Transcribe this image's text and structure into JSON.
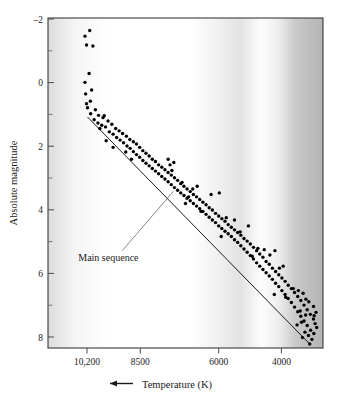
{
  "chart_data": {
    "type": "scatter",
    "title": "",
    "subtitle": "",
    "xlabel": "Temperature (K)",
    "ylabel": "Absolute magnitude",
    "xlabel_prefix_icon": "left-arrow",
    "grid": false,
    "legend": null,
    "x_axis_reversed": true,
    "y_axis_reversed": true,
    "xlim": [
      11400,
      2700
    ],
    "ylim": [
      -2,
      8
    ],
    "x_ticks": [
      10200,
      8500,
      6000,
      4000
    ],
    "x_tick_labels": [
      "10,200",
      "8500",
      "6000",
      "4000"
    ],
    "y_ticks": [
      -2,
      0,
      2,
      4,
      6,
      8
    ],
    "y_tick_labels": [
      "–2",
      "0",
      "2",
      "4",
      "6",
      "8"
    ],
    "y_minor_ticks": [
      -1,
      1,
      3,
      5,
      7
    ],
    "annotations": [
      {
        "text": "Main sequence",
        "x": 9050,
        "y": 5.35,
        "leader_from_x": 9050,
        "leader_from_y": 5.05,
        "leader_to_x": 7430,
        "leader_to_y": 3.25
      }
    ],
    "trend_line": {
      "name": "Main sequence ridge",
      "x_start": 10150,
      "y_start": 1.0,
      "x_end": 3150,
      "y_end": 7.85
    },
    "background_gradient": {
      "description": "stellar color continuum behind plot",
      "stops": [
        {
          "pos": 0.0,
          "color": "#dcdcdc"
        },
        {
          "pos": 0.1,
          "color": "#f5f5f5"
        },
        {
          "pos": 0.22,
          "color": "#ffffff"
        },
        {
          "pos": 0.52,
          "color": "#ffffff"
        },
        {
          "pos": 0.62,
          "color": "#f0f0f0"
        },
        {
          "pos": 0.7,
          "color": "#e0e0e0"
        },
        {
          "pos": 0.78,
          "color": "#ffffff"
        },
        {
          "pos": 0.84,
          "color": "#f2f2f2"
        },
        {
          "pos": 0.9,
          "color": "#c8c8c8"
        },
        {
          "pos": 1.0,
          "color": "#b4b4b4"
        }
      ]
    },
    "marker": {
      "shape": "circle",
      "color": "#000000",
      "size_px": 3.4
    },
    "point_count": 171,
    "points": [
      [
        10080,
        -1.62
      ],
      [
        10230,
        -1.45
      ],
      [
        9980,
        -1.15
      ],
      [
        10180,
        -1.18
      ],
      [
        10100,
        -0.32
      ],
      [
        10230,
        -0.05
      ],
      [
        10020,
        0.18
      ],
      [
        10210,
        0.3
      ],
      [
        10060,
        0.52
      ],
      [
        10180,
        0.6
      ],
      [
        9900,
        0.78
      ],
      [
        10150,
        0.72
      ],
      [
        9800,
        0.95
      ],
      [
        10050,
        0.9
      ],
      [
        9660,
        1.02
      ],
      [
        9940,
        1.08
      ],
      [
        9500,
        1.12
      ],
      [
        9820,
        1.18
      ],
      [
        9380,
        1.22
      ],
      [
        9700,
        1.25
      ],
      [
        9260,
        1.35
      ],
      [
        9580,
        1.3
      ],
      [
        9150,
        1.42
      ],
      [
        9460,
        1.45
      ],
      [
        9040,
        1.5
      ],
      [
        9340,
        1.52
      ],
      [
        9620,
        0.96
      ],
      [
        9760,
        1.35
      ],
      [
        8920,
        1.58
      ],
      [
        9230,
        1.62
      ],
      [
        8810,
        1.68
      ],
      [
        9120,
        1.7
      ],
      [
        8700,
        1.75
      ],
      [
        9010,
        1.78
      ],
      [
        8600,
        1.82
      ],
      [
        8900,
        1.88
      ],
      [
        8500,
        1.92
      ],
      [
        8800,
        1.95
      ],
      [
        8400,
        2.02
      ],
      [
        8700,
        2.05
      ],
      [
        9340,
        1.92
      ],
      [
        9560,
        1.72
      ],
      [
        8300,
        2.1
      ],
      [
        8600,
        2.14
      ],
      [
        8200,
        2.18
      ],
      [
        8500,
        2.22
      ],
      [
        8100,
        2.28
      ],
      [
        8400,
        2.32
      ],
      [
        8000,
        2.35
      ],
      [
        8300,
        2.4
      ],
      [
        7900,
        2.45
      ],
      [
        8200,
        2.48
      ],
      [
        7800,
        2.52
      ],
      [
        8100,
        2.56
      ],
      [
        8760,
        2.28
      ],
      [
        8940,
        2.06
      ],
      [
        7700,
        2.6
      ],
      [
        8000,
        2.64
      ],
      [
        7600,
        2.68
      ],
      [
        7900,
        2.72
      ],
      [
        7500,
        2.76
      ],
      [
        7800,
        2.8
      ],
      [
        7400,
        2.84
      ],
      [
        7700,
        2.88
      ],
      [
        7300,
        2.92
      ],
      [
        7600,
        2.96
      ],
      [
        7200,
        3.02
      ],
      [
        7500,
        3.05
      ],
      [
        7600,
        2.28
      ],
      [
        7540,
        2.45
      ],
      [
        7480,
        2.62
      ],
      [
        7420,
        2.38
      ],
      [
        7100,
        3.1
      ],
      [
        7400,
        3.14
      ],
      [
        7000,
        3.18
      ],
      [
        7300,
        3.22
      ],
      [
        6900,
        3.26
      ],
      [
        7200,
        3.3
      ],
      [
        6800,
        3.35
      ],
      [
        7100,
        3.38
      ],
      [
        6700,
        3.42
      ],
      [
        7000,
        3.46
      ],
      [
        6600,
        3.5
      ],
      [
        6900,
        3.54
      ],
      [
        7160,
        2.98
      ],
      [
        7050,
        3.62
      ],
      [
        6500,
        3.58
      ],
      [
        6800,
        3.62
      ],
      [
        6400,
        3.66
      ],
      [
        6700,
        3.7
      ],
      [
        6300,
        3.75
      ],
      [
        6600,
        3.78
      ],
      [
        6200,
        3.82
      ],
      [
        6500,
        3.86
      ],
      [
        6100,
        3.92
      ],
      [
        6400,
        3.95
      ],
      [
        6820,
        3.18
      ],
      [
        6680,
        3.1
      ],
      [
        6950,
        3.42
      ],
      [
        6560,
        3.86
      ],
      [
        6000,
        4.0
      ],
      [
        6300,
        4.04
      ],
      [
        5900,
        4.08
      ],
      [
        6200,
        4.12
      ],
      [
        5800,
        4.16
      ],
      [
        6100,
        4.2
      ],
      [
        5700,
        4.26
      ],
      [
        6000,
        4.3
      ],
      [
        5600,
        4.34
      ],
      [
        5900,
        4.38
      ],
      [
        5500,
        4.42
      ],
      [
        5800,
        4.46
      ],
      [
        6240,
        3.35
      ],
      [
        5980,
        3.3
      ],
      [
        5920,
        4.62
      ],
      [
        5760,
        4.05
      ],
      [
        5400,
        4.5
      ],
      [
        5700,
        4.54
      ],
      [
        5300,
        4.58
      ],
      [
        5600,
        4.62
      ],
      [
        5200,
        4.68
      ],
      [
        5500,
        4.72
      ],
      [
        5100,
        4.76
      ],
      [
        5400,
        4.8
      ],
      [
        5000,
        4.85
      ],
      [
        5300,
        4.9
      ],
      [
        4900,
        4.95
      ],
      [
        5200,
        5.0
      ],
      [
        5500,
        4.12
      ],
      [
        5320,
        4.48
      ],
      [
        5060,
        4.3
      ],
      [
        4940,
        5.22
      ],
      [
        4800,
        5.05
      ],
      [
        5100,
        5.1
      ],
      [
        4700,
        5.15
      ],
      [
        5000,
        5.2
      ],
      [
        4600,
        5.25
      ],
      [
        4900,
        5.3
      ],
      [
        4500,
        5.38
      ],
      [
        4800,
        5.42
      ],
      [
        4400,
        5.46
      ],
      [
        4700,
        5.52
      ],
      [
        4300,
        5.58
      ],
      [
        4600,
        5.62
      ],
      [
        4760,
        4.98
      ],
      [
        4560,
        5.02
      ],
      [
        4380,
        5.18
      ],
      [
        4220,
        5.05
      ],
      [
        4200,
        5.68
      ],
      [
        4500,
        5.72
      ],
      [
        4100,
        5.78
      ],
      [
        4400,
        5.82
      ],
      [
        4000,
        5.88
      ],
      [
        4300,
        5.92
      ],
      [
        3900,
        5.98
      ],
      [
        4200,
        6.04
      ],
      [
        3800,
        6.1
      ],
      [
        4100,
        6.14
      ],
      [
        3700,
        6.2
      ],
      [
        4000,
        6.26
      ],
      [
        4080,
        5.58
      ],
      [
        3960,
        5.52
      ],
      [
        4240,
        6.38
      ],
      [
        3880,
        6.46
      ],
      [
        3600,
        6.32
      ],
      [
        3900,
        6.38
      ],
      [
        3500,
        6.44
      ],
      [
        3800,
        6.5
      ],
      [
        3400,
        6.56
      ],
      [
        3700,
        6.62
      ],
      [
        3300,
        6.7
      ],
      [
        3600,
        6.76
      ],
      [
        3200,
        6.84
      ],
      [
        3500,
        6.9
      ],
      [
        3100,
        6.98
      ],
      [
        3400,
        7.04
      ],
      [
        3640,
        6.2
      ],
      [
        3480,
        6.26
      ],
      [
        3330,
        6.34
      ],
      [
        3240,
        6.52
      ],
      [
        3000,
        7.12
      ],
      [
        3300,
        7.18
      ],
      [
        2950,
        7.26
      ],
      [
        3200,
        7.32
      ],
      [
        3090,
        7.46
      ],
      [
        2990,
        7.56
      ],
      [
        3160,
        7.62
      ],
      [
        3050,
        7.74
      ],
      [
        3380,
        7.22
      ],
      [
        3250,
        7.0
      ],
      [
        2920,
        6.92
      ],
      [
        3420,
        6.88
      ],
      [
        2980,
        7.02
      ],
      [
        3120,
        7.88
      ],
      [
        3270,
        7.52
      ],
      [
        3520,
        7.3
      ],
      [
        3000,
        6.74
      ],
      [
        3150,
        6.6
      ],
      [
        2900,
        7.38
      ],
      [
        3350,
        7.68
      ]
    ]
  },
  "figure": {
    "frame_color": "#3a3a3a",
    "axis_line_color": "#555555",
    "trend_line_color": "#1a1a1a",
    "leader_line_color": "#6a6a6a",
    "point_color": "#000000"
  }
}
